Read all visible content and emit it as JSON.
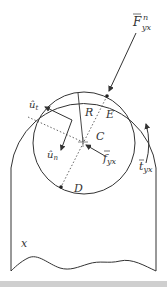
{
  "diagram": {
    "labels": {
      "force_normal": "F",
      "force_normal_sup": "n",
      "force_normal_sub": "yx",
      "radius": "R",
      "point_e": "E",
      "center": "C",
      "point_d": "D",
      "unit_t": "û",
      "unit_t_sub": "t",
      "unit_n": "û",
      "unit_n_sub": "n",
      "force_f": "f",
      "force_f_sub": "yx",
      "torque": "t",
      "torque_sub": "yx",
      "body": "x"
    },
    "colors": {
      "stroke": "#333333",
      "background": "#ffffff",
      "bar": "#cfcfcf"
    }
  }
}
